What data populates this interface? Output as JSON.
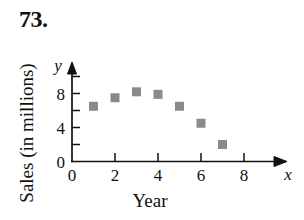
{
  "figure": {
    "problem_number": "73.",
    "ylabel": "Sales (in millions)",
    "xlabel": "Year",
    "x_axis_letter": "x",
    "y_axis_letter": "y"
  },
  "chart_data": {
    "type": "scatter",
    "title": "73.",
    "xlabel": "Year",
    "ylabel": "Sales (in millions)",
    "x": [
      1,
      2,
      3,
      4,
      5,
      6,
      7
    ],
    "values": [
      6.5,
      7.5,
      8.2,
      7.9,
      6.5,
      4.5,
      2.0
    ],
    "series": [
      {
        "name": "Sales",
        "points": [
          {
            "x": 1,
            "y": 6.5
          },
          {
            "x": 2,
            "y": 7.5
          },
          {
            "x": 3,
            "y": 8.2
          },
          {
            "x": 4,
            "y": 7.9
          },
          {
            "x": 5,
            "y": 6.5
          },
          {
            "x": 6,
            "y": 4.5
          },
          {
            "x": 7,
            "y": 2.0
          }
        ]
      }
    ],
    "xlim": [
      0,
      9.5
    ],
    "ylim": [
      0,
      10.5
    ],
    "xticks": [
      0,
      2,
      4,
      6,
      8
    ],
    "xtick_labels": [
      "0",
      "2",
      "4",
      "6",
      "8"
    ],
    "xticks_minor": [
      1,
      3,
      5,
      7
    ],
    "yticks": [
      0,
      4,
      8
    ],
    "ytick_labels": [
      "0",
      "4",
      "8"
    ],
    "yticks_minor": [
      2,
      6,
      10
    ],
    "grid": false,
    "legend": false,
    "marker": "square",
    "marker_color": "#8a8a8a",
    "axis_color": "#111111"
  },
  "ticks": {
    "y_labels": [
      {
        "text": "8",
        "value": 8
      },
      {
        "text": "4",
        "value": 4
      },
      {
        "text": "0",
        "value": 0
      }
    ],
    "x_labels": [
      {
        "text": "0",
        "value": 0
      },
      {
        "text": "2",
        "value": 2
      },
      {
        "text": "4",
        "value": 4
      },
      {
        "text": "6",
        "value": 6
      },
      {
        "text": "8",
        "value": 8
      }
    ]
  }
}
